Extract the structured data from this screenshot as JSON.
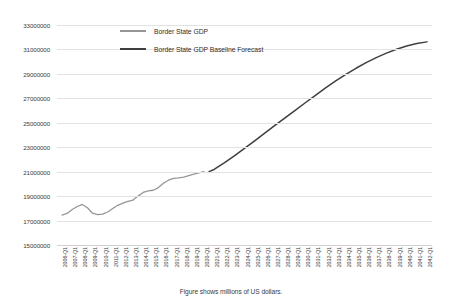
{
  "chart_data": {
    "type": "line",
    "title": "",
    "xlabel": "",
    "ylabel": "",
    "caption": "Figure shows millions of US dollars.",
    "ylim": [
      15000000,
      33000000
    ],
    "ytick_step": 2000000,
    "yticks": [
      "33000000",
      "31000000",
      "29000000",
      "27000000",
      "25000000",
      "23000000",
      "21000000",
      "19000000",
      "17000000",
      "15000000"
    ],
    "grid": true,
    "legend_position": "top-center",
    "xticks": [
      "2006-Q1",
      "2007-Q1",
      "2008-Q1",
      "2009-Q1",
      "2010-Q1",
      "2011-Q1",
      "2012-Q1",
      "2013-Q1",
      "2014-Q1",
      "2015-Q1",
      "2016-Q1",
      "2017-Q1",
      "2018-Q1",
      "2019-Q1",
      "2020-Q1",
      "2021-Q1",
      "2022-Q1",
      "2023-Q1",
      "2024-Q1",
      "2025-Q1",
      "2026-Q1",
      "2027-Q1",
      "2028-Q1",
      "2029-Q1",
      "2030-Q1",
      "2031-Q1",
      "2032-Q1",
      "2033-Q1",
      "2034-Q1",
      "2035-Q1",
      "2036-Q1",
      "2037-Q1",
      "2038-Q1",
      "2039-Q1",
      "2040-Q1",
      "2041-Q1",
      "2042-Q1"
    ],
    "series": [
      {
        "name": "Border State GDP",
        "color": "#969696",
        "x": [
          "2006-Q1",
          "2006-Q3",
          "2007-Q1",
          "2007-Q3",
          "2008-Q1",
          "2008-Q3",
          "2009-Q1",
          "2009-Q3",
          "2010-Q1",
          "2010-Q3",
          "2011-Q1",
          "2011-Q3",
          "2012-Q1",
          "2012-Q3",
          "2013-Q1",
          "2013-Q3",
          "2014-Q1",
          "2014-Q3",
          "2015-Q1",
          "2015-Q3",
          "2016-Q1",
          "2016-Q3",
          "2017-Q1",
          "2017-Q3",
          "2018-Q1",
          "2018-Q3",
          "2019-Q1",
          "2019-Q3",
          "2020-Q1"
        ],
        "values": [
          17450000,
          17580000,
          17900000,
          18150000,
          18320000,
          18050000,
          17600000,
          17480000,
          17520000,
          17700000,
          17980000,
          18250000,
          18420000,
          18560000,
          18680000,
          19000000,
          19300000,
          19420000,
          19480000,
          19700000,
          20050000,
          20300000,
          20450000,
          20500000,
          20560000,
          20680000,
          20800000,
          20900000,
          21000000
        ]
      },
      {
        "name": "Border State GDP Baseline Forecast",
        "color": "#3f3f3f",
        "x": [
          "2020-Q3",
          "2021-Q1",
          "2022-Q1",
          "2023-Q1",
          "2024-Q1",
          "2025-Q1",
          "2026-Q1",
          "2027-Q1",
          "2028-Q1",
          "2029-Q1",
          "2030-Q1",
          "2031-Q1",
          "2032-Q1",
          "2033-Q1",
          "2034-Q1",
          "2035-Q1",
          "2036-Q1",
          "2037-Q1",
          "2038-Q1",
          "2039-Q1",
          "2040-Q1",
          "2041-Q1",
          "2042-Q1"
        ],
        "values": [
          21000000,
          21180000,
          21720000,
          22300000,
          22900000,
          23520000,
          24150000,
          24780000,
          25400000,
          26020000,
          26640000,
          27250000,
          27850000,
          28420000,
          28960000,
          29460000,
          29920000,
          30330000,
          30700000,
          31020000,
          31280000,
          31480000,
          31620000
        ]
      }
    ]
  }
}
